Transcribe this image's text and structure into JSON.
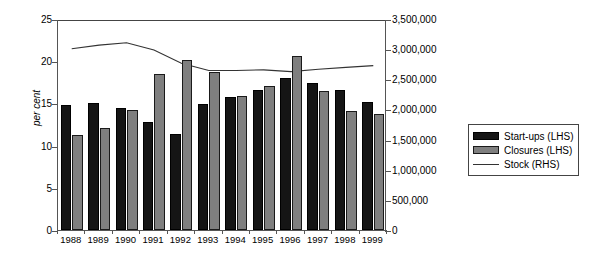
{
  "chart_data": {
    "type": "bar",
    "title": "",
    "subtitle": "",
    "xlabel": "",
    "ylabel": "per cent",
    "ylabel_right": "",
    "categories": [
      "1988",
      "1989",
      "1990",
      "1991",
      "1992",
      "1993",
      "1994",
      "1995",
      "1996",
      "1997",
      "1998",
      "1999"
    ],
    "ylim": [
      0,
      25
    ],
    "yticks": [
      0,
      5,
      10,
      15,
      20,
      25
    ],
    "ytick_labels": [
      "0",
      "5",
      "10",
      "15",
      "20",
      "25"
    ],
    "ylim_right": [
      0,
      3500000
    ],
    "yticks_right": [
      0,
      500000,
      1000000,
      1500000,
      2000000,
      2500000,
      3000000,
      3500000
    ],
    "ytick_labels_right": [
      "0",
      "500,000",
      "1,000,000",
      "1,500,000",
      "2,000,000",
      "2,500,000",
      "3,000,000",
      "3,500,000"
    ],
    "grid": false,
    "legend_position": "right",
    "series": [
      {
        "name": "Start-ups (LHS)",
        "type": "bar",
        "axis": "left",
        "color": "#151515",
        "values": [
          14.8,
          15.1,
          14.4,
          12.8,
          11.4,
          14.9,
          15.8,
          16.6,
          18.0,
          17.4,
          16.6,
          15.2
        ]
      },
      {
        "name": "Closures (LHS)",
        "type": "bar",
        "axis": "left",
        "color": "#7f7f7f",
        "values": [
          11.2,
          12.1,
          14.2,
          18.5,
          20.2,
          18.7,
          15.9,
          17.1,
          20.6,
          16.5,
          14.1,
          13.7
        ]
      },
      {
        "name": "Stock (RHS)",
        "type": "line",
        "axis": "right",
        "color": "#333333",
        "values": [
          3040000,
          3100000,
          3140000,
          3020000,
          2800000,
          2680000,
          2680000,
          2690000,
          2660000,
          2700000,
          2730000,
          2760000
        ]
      }
    ]
  },
  "legend": {
    "items": [
      {
        "label": "Start-ups (LHS)",
        "swatch": "startups"
      },
      {
        "label": "Closures (LHS)",
        "swatch": "closures"
      },
      {
        "label": "Stock (RHS)",
        "swatch": "stock"
      }
    ]
  }
}
